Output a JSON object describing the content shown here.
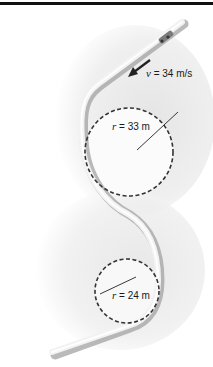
{
  "figure": {
    "type": "roller-coaster track diagram",
    "velocity_label": {
      "symbol": "v",
      "equals": " = ",
      "value": "34 m/s"
    },
    "loops": [
      {
        "name": "upper-loop",
        "radius_symbol": "r",
        "equals": " = ",
        "radius": "33 m",
        "direction": "right of track"
      },
      {
        "name": "lower-loop",
        "radius_symbol": "r",
        "equals": " = ",
        "radius": "24 m",
        "direction": "left of track"
      }
    ],
    "colors": {
      "track_light": "#f4f4f4",
      "track_shadow": "#9a9a9a",
      "background_shade": "#e6e6e6",
      "dash": "#333333",
      "rule": "#111111"
    }
  }
}
